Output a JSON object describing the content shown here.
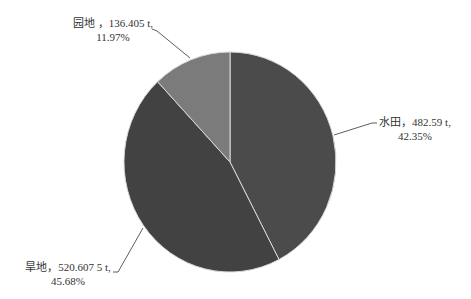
{
  "chart_data": {
    "type": "pie",
    "title": "",
    "unit": "t",
    "start_angle_deg": 0,
    "direction": "clockwise",
    "slices": [
      {
        "name": "水田",
        "value": 482.59,
        "value_label": "482.59 t",
        "percent": 42.35,
        "percent_label": "42.35%",
        "color": "#4b4b4b"
      },
      {
        "name": "旱地",
        "value": 520.6075,
        "value_label": "520.607 5 t",
        "percent": 45.68,
        "percent_label": "45.68%",
        "color": "#424242"
      },
      {
        "name": "园地",
        "value": 136.405,
        "value_label": "136.405 t",
        "percent": 11.97,
        "percent_label": "11.97%",
        "color": "#7b7b7b"
      }
    ],
    "legend": "none",
    "data_labels": "outside with leader lines"
  },
  "labels": {
    "paddy": {
      "line1": "水田，482.59 t,",
      "line2": "42.35%"
    },
    "dryland": {
      "line1": "旱地，520.607 5 t,",
      "line2": "45.68%"
    },
    "garden": {
      "line1": "园地 ，136.405 t,",
      "line2": "11.97%"
    }
  },
  "colors": {
    "separator": "#d9d9d9",
    "leader": "#333333",
    "text": "#333333"
  }
}
